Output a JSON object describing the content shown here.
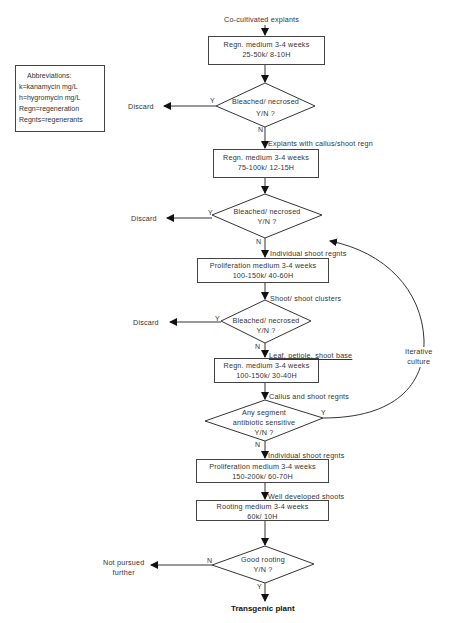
{
  "abbreviations": {
    "title": "Abbreviations:",
    "items": [
      "k=kanamycin  mg/L",
      "h=hygromycin  mg/L",
      "Regn=regeneration",
      "Regnts=regenerants"
    ]
  },
  "start_label": "Co-cultivated  explants",
  "steps": [
    {
      "line1": "Regn. medium  3-4 weeks",
      "line2": "25-50k/ 8-10H"
    },
    {
      "line1": "Regn. medium  3-4 weeks",
      "line2": "75-100k/ 12-15H"
    },
    {
      "line1": "Proliferation medium   3-4 weeks",
      "line2": "100-150k/ 40-60H"
    },
    {
      "line1": "Regn. medium  3-4 weeks",
      "line2": "100-150k/ 30-40H"
    },
    {
      "line1": "Proliferation medium   3-4 weeks",
      "line2": "150-200k/ 60-70H"
    },
    {
      "line1": "Rooting medium   3-4 weeks",
      "line2": "60k/ 10H"
    }
  ],
  "decisions": [
    {
      "line1": "Bleached/ necrosed",
      "line2": "Y/N  ?",
      "yes": "Y",
      "no": "N"
    },
    {
      "line1": "Bleached/ necrosed",
      "line2": "Y/N  ?",
      "yes": "Y",
      "no": "N"
    },
    {
      "line1": "Bleached/ necrosed",
      "line2": "Y/N  ?",
      "yes": "Y",
      "no": "N"
    },
    {
      "line1": "Any segment",
      "line2": "antibiotic  sensitive",
      "line3": "Y/N  ?",
      "yes": "Y",
      "no": "N"
    },
    {
      "line1": "Good rooting",
      "line2": "Y/N  ?",
      "yes": "Y",
      "no": "N"
    }
  ],
  "edge_labels": {
    "after_d1": "Explants  with  callus/shoot  regn",
    "after_d2": "Individual  shoot  regnts",
    "after_b3": "Shoot/ shoot  clusters",
    "after_d3": "Leaf,  petiole,  shoot  base",
    "after_b4": "Callus  and  shoot  regnts",
    "after_d4": "Individual  shoot  regnts",
    "after_b5": "Well  developed  shoots"
  },
  "outcomes": {
    "discard_1": "Discard",
    "discard_2": "Discard",
    "discard_3": "Discard",
    "not_pursued_line1": "Not  pursued",
    "not_pursued_line2": "further",
    "loop_line1": "Iterative",
    "loop_line2": "culture",
    "final": "Transgenic     plant"
  }
}
